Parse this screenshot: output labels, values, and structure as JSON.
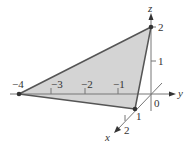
{
  "diagram": {
    "type": "3d-coordinate-plot",
    "axes": {
      "x": {
        "label": "x",
        "ticks": [
          "1",
          "2"
        ]
      },
      "y": {
        "label": "y",
        "ticks": [
          "-4",
          "-3",
          "-2",
          "-1"
        ]
      },
      "z": {
        "label": "z",
        "ticks": [
          "1",
          "2"
        ]
      },
      "origin_label": "0"
    },
    "vertices": [
      {
        "name": "A",
        "coords": [
          0,
          -4,
          0
        ]
      },
      {
        "name": "B",
        "coords": [
          0,
          0,
          2
        ]
      },
      {
        "name": "C",
        "coords": [
          1,
          0,
          0
        ]
      }
    ],
    "colors": {
      "fill": "#d4d4d4",
      "edge": "#555555",
      "axis": "#777777",
      "point": "#333333"
    }
  },
  "labels": {
    "y_neg4": "−4",
    "y_neg3": "−3",
    "y_neg2": "−2",
    "y_neg1": "−1",
    "z_1": "1",
    "z_2": "2",
    "x_1": "1",
    "x_2": "2",
    "origin": "0",
    "x_axis": "x",
    "y_axis": "y",
    "z_axis": "z"
  }
}
